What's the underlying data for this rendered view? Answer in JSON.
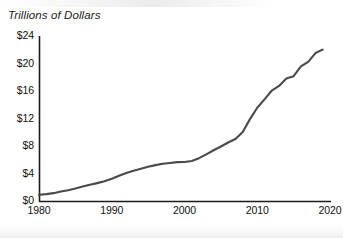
{
  "chart_data": {
    "type": "line",
    "title": "",
    "subtitle": "",
    "axis_note": "Trillions of Dollars",
    "xlabel": "",
    "ylabel": "Trillions of Dollars",
    "xlim": [
      1980,
      2020
    ],
    "ylim": [
      0,
      24
    ],
    "grid": false,
    "legend": null,
    "legend_position": "none",
    "line_color": "#4a4a4a",
    "line_width": 2.1,
    "axis_color": "#1c1c1c",
    "x_ticks": [
      1980,
      1990,
      2000,
      2010,
      2020
    ],
    "x_tick_labels": [
      "1980",
      "1990",
      "2000",
      "2010",
      "2020"
    ],
    "y_ticks": [
      0,
      4,
      8,
      12,
      16,
      20,
      24
    ],
    "y_tick_labels": [
      "$0",
      "$4",
      "$8",
      "$12",
      "$16",
      "$20",
      "$24"
    ],
    "series": [
      {
        "name": "Gross Federal Debt",
        "x": [
          1980,
          1981,
          1982,
          1983,
          1984,
          1985,
          1986,
          1987,
          1988,
          1989,
          1990,
          1991,
          1992,
          1993,
          1994,
          1995,
          1996,
          1997,
          1998,
          1999,
          2000,
          2001,
          2002,
          2003,
          2004,
          2005,
          2006,
          2007,
          2008,
          2009,
          2010,
          2011,
          2012,
          2013,
          2014,
          2015,
          2016,
          2017,
          2018,
          2019
        ],
        "values": [
          0.91,
          1.0,
          1.14,
          1.37,
          1.56,
          1.82,
          2.12,
          2.35,
          2.6,
          2.86,
          3.23,
          3.67,
          4.06,
          4.41,
          4.69,
          4.97,
          5.22,
          5.41,
          5.53,
          5.66,
          5.67,
          5.81,
          6.23,
          6.78,
          7.38,
          7.93,
          8.51,
          9.01,
          10.02,
          11.91,
          13.56,
          14.79,
          16.07,
          16.74,
          17.82,
          18.15,
          19.57,
          20.24,
          21.52,
          22.02
        ]
      }
    ],
    "annotations": []
  },
  "axis_title": {
    "text": "Trillions of Dollars"
  },
  "plot": {
    "geometry": {
      "left_px": 39,
      "right_px": 330,
      "top_px": 36,
      "bottom_px": 201
    }
  }
}
